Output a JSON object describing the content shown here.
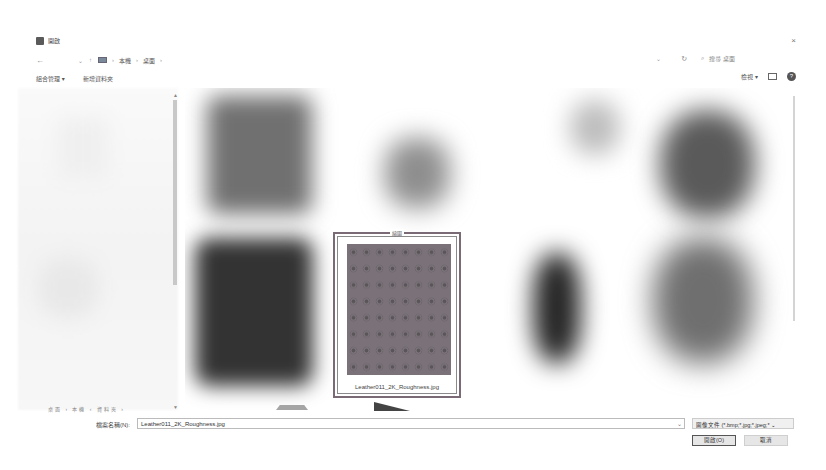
{
  "window": {
    "title": "開啟",
    "close_glyph": "×"
  },
  "navbar": {
    "back_glyph": "←",
    "forward_glyph": "→",
    "recent_glyph": "⌄",
    "up_glyph": "↑",
    "breadcrumbs": [
      "本機",
      "桌面"
    ],
    "crumb_sep": "›",
    "dropdown_glyph": "⌄",
    "refresh_glyph": "↻",
    "search_icon_glyph": "⌕",
    "search_placeholder": "搜尋 桌面"
  },
  "toolbar": {
    "organize_label": "組合管理 ▾",
    "new_folder_label": "新增資料夾",
    "view_label": "檢視 ▾",
    "help_glyph": "?"
  },
  "sidebar": {
    "bottom_text": "桌面 › 本機 ‹ 資料夾 ›",
    "scroll_up": "▲",
    "scroll_down": "▼"
  },
  "files": {
    "selected": {
      "top_caption": "縮圖",
      "name": "Leather011_2K_Roughness.jpg"
    }
  },
  "footer": {
    "filename_label": "檔案名稱(N):",
    "filename_value": "Leather011_2K_Roughness.jpg",
    "filename_dropdown_glyph": "⌄",
    "filetype_value": "圖像文件 (*.bmp;*.jpg;*.jpeg;* ⌄",
    "open_label": "開啟(O)",
    "cancel_label": "取消"
  },
  "colors": {
    "selection_border": "#7a6a75",
    "texture_base": "#7a7278"
  }
}
